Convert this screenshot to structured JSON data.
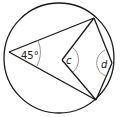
{
  "diagram": {
    "stroke_color": "#1a1a1a",
    "background": "#ffffff",
    "circle": {
      "cx": 59,
      "cy": 58,
      "r": 55
    },
    "points": {
      "A": {
        "x": 9,
        "y": 52,
        "desc": "left point on circle"
      },
      "B": {
        "x": 94,
        "y": 18,
        "desc": "top-right point on circle"
      },
      "C": {
        "x": 96,
        "y": 100,
        "desc": "bottom-right point on circle"
      },
      "O": {
        "x": 62,
        "y": 60,
        "desc": "centre of circle"
      },
      "D": {
        "x": 112,
        "y": 63,
        "desc": "right point on circle"
      }
    },
    "labels": {
      "angle_A": "45°",
      "angle_O": "c",
      "angle_D": "d"
    }
  }
}
